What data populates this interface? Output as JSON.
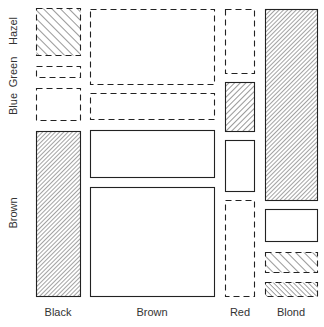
{
  "chart_data": {
    "type": "mosaic",
    "title": "",
    "xlabel": "Hair color",
    "ylabel": "Eye color",
    "x_categories": [
      "Black",
      "Brown",
      "Red",
      "Blond"
    ],
    "y_categories": [
      "Hazel",
      "Green",
      "Blue",
      "Brown"
    ],
    "legend": "",
    "encoding": {
      "solid_border": "positive residual",
      "dashed_border": "negative residual",
      "hatch_density": "residual magnitude"
    },
    "tiles": [
      {
        "hair": "Black",
        "eye": "Hazel",
        "x": 36,
        "y": 8,
        "w": 44,
        "h": 47,
        "border": "dashed",
        "hatch": "forward-sparse"
      },
      {
        "hair": "Black",
        "eye": "Green",
        "x": 36,
        "y": 66,
        "w": 44,
        "h": 11,
        "border": "dashed",
        "hatch": "none"
      },
      {
        "hair": "Black",
        "eye": "Blue",
        "x": 36,
        "y": 88,
        "w": 44,
        "h": 32,
        "border": "dashed",
        "hatch": "none"
      },
      {
        "hair": "Black",
        "eye": "Brown",
        "x": 36,
        "y": 131,
        "w": 44,
        "h": 165,
        "border": "solid",
        "hatch": "back-dense"
      },
      {
        "hair": "Brown",
        "eye": "Hazel",
        "x": 90,
        "y": 9,
        "w": 124,
        "h": 75,
        "border": "dashed",
        "hatch": "none"
      },
      {
        "hair": "Brown",
        "eye": "Green",
        "x": 90,
        "y": 93,
        "w": 124,
        "h": 26,
        "border": "dashed",
        "hatch": "none"
      },
      {
        "hair": "Brown",
        "eye": "Blue",
        "x": 90,
        "y": 130,
        "w": 124,
        "h": 47,
        "border": "solid",
        "hatch": "none"
      },
      {
        "hair": "Brown",
        "eye": "Brown",
        "x": 90,
        "y": 187,
        "w": 124,
        "h": 109,
        "border": "solid",
        "hatch": "none"
      },
      {
        "hair": "Red",
        "eye": "Hazel",
        "x": 225,
        "y": 9,
        "w": 29,
        "h": 64,
        "border": "dashed",
        "hatch": "none"
      },
      {
        "hair": "Red",
        "eye": "Green",
        "x": 225,
        "y": 82,
        "w": 29,
        "h": 49,
        "border": "solid",
        "hatch": "back-medium"
      },
      {
        "hair": "Red",
        "eye": "Blue",
        "x": 225,
        "y": 140,
        "w": 29,
        "h": 51,
        "border": "solid",
        "hatch": "none"
      },
      {
        "hair": "Red",
        "eye": "Brown",
        "x": 225,
        "y": 200,
        "w": 29,
        "h": 96,
        "border": "dashed",
        "hatch": "none"
      },
      {
        "hair": "Blond",
        "eye": "Hazel",
        "x": 265,
        "y": 9,
        "w": 52,
        "h": 191,
        "border": "solid",
        "hatch": "back-dense"
      },
      {
        "hair": "Blond",
        "eye": "Green",
        "x": 265,
        "y": 209,
        "w": 52,
        "h": 32,
        "border": "solid",
        "hatch": "none"
      },
      {
        "hair": "Blond",
        "eye": "Blue",
        "x": 265,
        "y": 252,
        "w": 52,
        "h": 20,
        "border": "dashed",
        "hatch": "forward-sparse"
      },
      {
        "hair": "Blond",
        "eye": "Brown",
        "x": 265,
        "y": 282,
        "w": 52,
        "h": 14,
        "border": "dashed",
        "hatch": "forward-dense"
      }
    ]
  },
  "labels": {
    "y": [
      {
        "text": "Hazel",
        "cy": 31
      },
      {
        "text": "Green",
        "cy": 72
      },
      {
        "text": "Blue",
        "cy": 104
      },
      {
        "text": "Brown",
        "cy": 213
      }
    ],
    "x": [
      {
        "text": "Black",
        "cx": 58
      },
      {
        "text": "Brown",
        "cx": 152
      },
      {
        "text": "Red",
        "cx": 240
      },
      {
        "text": "Blond",
        "cx": 291
      }
    ]
  }
}
